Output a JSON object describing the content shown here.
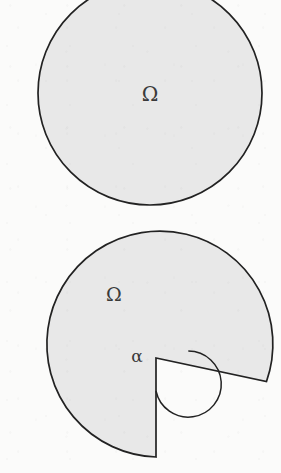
{
  "page": {
    "background_color": "#fbfbfa",
    "width": 281,
    "height": 473
  },
  "style": {
    "fill_color": "#e8e8e8",
    "stroke_color": "#222222",
    "label_color": "#3a3a3a",
    "stroke_width": 1.6
  },
  "figures": [
    {
      "id": "full-disk",
      "kind": "disk",
      "caption": "",
      "domain_label": "Ω",
      "geometry": {
        "center_x": 150,
        "center_y": 93,
        "radius": 112,
        "cropped_at_top": true
      },
      "label_position": {
        "x": 150,
        "y": 95
      }
    },
    {
      "id": "reentrant-corner-disk",
      "kind": "disk-with-wedge-removed",
      "caption": "",
      "domain_label": "Ω",
      "angle_label": "α",
      "geometry": {
        "center_x": 156,
        "center_y": 358,
        "radius": 113,
        "wedge_start_angle_deg": 12,
        "wedge_end_angle_deg": 90,
        "interior_angle_deg": 282,
        "angle_arc_radius": 33
      },
      "label_position": {
        "x": 114,
        "y": 296
      },
      "angle_label_position": {
        "x": 137,
        "y": 356
      }
    }
  ]
}
